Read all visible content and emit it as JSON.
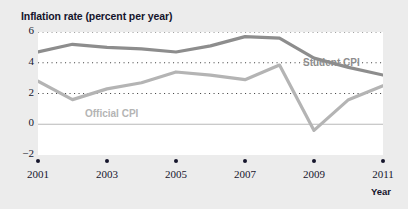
{
  "chart_data": {
    "type": "line",
    "title": "Inflation rate (percent per year)",
    "xlabel": "Year",
    "ylabel": "Inflation rate (percent per year)",
    "x": [
      2001,
      2002,
      2003,
      2004,
      2005,
      2006,
      2007,
      2008,
      2009,
      2010,
      2011
    ],
    "xlim": [
      2001,
      2011
    ],
    "ylim": [
      -2,
      6
    ],
    "yticks": [
      6,
      4,
      2,
      0,
      -2
    ],
    "ytick_labels": [
      "6",
      "4",
      "2",
      "0",
      "−2"
    ],
    "xticks": [
      2001,
      2003,
      2005,
      2007,
      2009,
      2011
    ],
    "xtick_labels": [
      "2001",
      "2003",
      "2005",
      "2007",
      "2009",
      "2011"
    ],
    "grid": "dotted horizontal gridlines at 2, 4 and 6; solid zero line at 0",
    "legend_position": "inline labels on plot",
    "series": [
      {
        "name": "Student CPI",
        "color": "#8d8d8d",
        "values": [
          4.7,
          5.2,
          5.0,
          4.9,
          4.7,
          5.1,
          5.7,
          5.6,
          4.3,
          3.7,
          3.2
        ]
      },
      {
        "name": "Official CPI",
        "color": "#b4b4b4",
        "values": [
          2.8,
          1.6,
          2.3,
          2.7,
          3.4,
          3.2,
          2.9,
          3.85,
          -0.4,
          1.6,
          2.5
        ]
      }
    ],
    "annotations": [
      {
        "text": "Student CPI",
        "series": "Student CPI",
        "x": 2009,
        "y": 4.9
      },
      {
        "text": "Official CPI",
        "series": "Official CPI",
        "x": 2003,
        "y": 0.9
      }
    ]
  },
  "colors": {
    "page_background": "#ececec",
    "plot_background": "#ffffff",
    "text": "#16162c",
    "gridline": "#4a4a4a",
    "zero_line": "#b9b9b9",
    "student_cpi": "#8d8d8d",
    "official_cpi": "#b4b4b4"
  }
}
